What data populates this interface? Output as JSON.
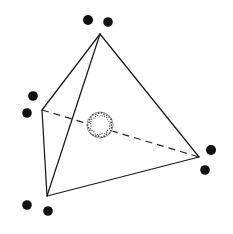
{
  "figure": {
    "width": 233,
    "height": 234,
    "background_color": "#ffffff",
    "line_color": "#1a1a1a",
    "dot_color": "#111111",
    "sphere_outline_color": "#6b6b6b",
    "sphere_fill_color": "#ffffff"
  },
  "polyhedron": {
    "name": "tetrahedron",
    "vertex_count": 4,
    "edge_count": 6,
    "vertices": [
      {
        "id": "apex",
        "label": "apex vertex",
        "x": 100,
        "y": 34
      },
      {
        "id": "left",
        "label": "left vertex",
        "x": 42,
        "y": 110
      },
      {
        "id": "bottom",
        "label": "bottom front vertex",
        "x": 47,
        "y": 196
      },
      {
        "id": "right",
        "label": "right vertex",
        "x": 199,
        "y": 157
      }
    ],
    "edges": [
      {
        "id": "apex-left",
        "from": "apex",
        "to": "left",
        "style": "solid"
      },
      {
        "id": "apex-bottom",
        "from": "apex",
        "to": "bottom",
        "style": "solid"
      },
      {
        "id": "apex-right",
        "from": "apex",
        "to": "right",
        "style": "solid"
      },
      {
        "id": "left-bottom",
        "from": "left",
        "to": "bottom",
        "style": "solid"
      },
      {
        "id": "bottom-right",
        "from": "bottom",
        "to": "right",
        "style": "solid"
      },
      {
        "id": "left-right",
        "from": "left",
        "to": "right",
        "style": "dashed"
      }
    ],
    "dash_pattern": "7 5"
  },
  "sphere": {
    "label": "inscribed stippled sphere",
    "cx": 100,
    "cy": 125,
    "r": 13,
    "texture": "stippled",
    "stipple_count": 26
  },
  "satellite_dots": [
    {
      "id": "dot-top-left",
      "label": "top left dot",
      "x": 88,
      "y": 20,
      "r": 5.0
    },
    {
      "id": "dot-top-right",
      "label": "top right dot",
      "x": 108,
      "y": 22,
      "r": 4.8
    },
    {
      "id": "dot-left-upper",
      "label": "left upper dot",
      "x": 33,
      "y": 96,
      "r": 4.8
    },
    {
      "id": "dot-left-lower",
      "label": "left lower dot",
      "x": 27,
      "y": 113,
      "r": 4.8
    },
    {
      "id": "dot-bottom-left",
      "label": "bottom left dot",
      "x": 27,
      "y": 205,
      "r": 4.8
    },
    {
      "id": "dot-bottom-right",
      "label": "bottom right dot",
      "x": 48,
      "y": 211,
      "r": 4.8
    },
    {
      "id": "dot-right-upper",
      "label": "right upper dot",
      "x": 211,
      "y": 150,
      "r": 5.0
    },
    {
      "id": "dot-right-lower",
      "label": "right lower dot",
      "x": 205,
      "y": 170,
      "r": 4.8
    }
  ]
}
